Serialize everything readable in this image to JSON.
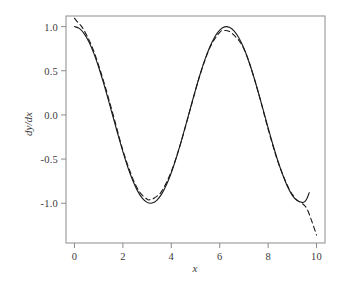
{
  "chart_data": {
    "type": "line",
    "title": "",
    "xlabel": "x",
    "ylabel": "dy/dx",
    "xlim": [
      -0.35,
      10.35
    ],
    "ylim": [
      -1.45,
      1.12
    ],
    "grid": false,
    "legend": "none",
    "xticks": [
      "0",
      "2",
      "4",
      "6",
      "8",
      "10"
    ],
    "xtick_values": [
      0,
      2,
      4,
      6,
      8,
      10
    ],
    "yticks": [
      "1.0",
      "0.5",
      "0.0",
      "-0.5",
      "-1.0"
    ],
    "ytick_values": [
      1.0,
      0.5,
      0.0,
      -0.5,
      -1.0
    ],
    "series": [
      {
        "name": "exact derivative",
        "style": "solid",
        "color": "#1a1a1a",
        "linewidth": 1.1,
        "x": [
          0.0,
          0.2,
          0.4,
          0.6,
          0.8,
          1.0,
          1.2,
          1.4,
          1.6,
          1.8,
          2.0,
          2.2,
          2.4,
          2.6,
          2.8,
          3.0,
          3.2,
          3.4,
          3.6,
          3.8,
          4.0,
          4.2,
          4.4,
          4.6,
          4.8,
          5.0,
          5.2,
          5.4,
          5.6,
          5.8,
          6.0,
          6.2,
          6.4,
          6.6,
          6.8,
          7.0,
          7.2,
          7.4,
          7.6,
          7.8,
          8.0,
          8.2,
          8.4,
          8.6,
          8.8,
          9.0,
          9.2,
          9.4,
          9.5,
          9.6,
          9.7
        ],
        "y": [
          1.0,
          0.98,
          0.921,
          0.825,
          0.697,
          0.54,
          0.362,
          0.17,
          -0.029,
          -0.227,
          -0.416,
          -0.589,
          -0.737,
          -0.857,
          -0.942,
          -0.99,
          -0.998,
          -0.967,
          -0.897,
          -0.791,
          -0.654,
          -0.49,
          -0.307,
          -0.112,
          0.087,
          0.284,
          0.469,
          0.635,
          0.775,
          0.886,
          0.96,
          0.997,
          0.993,
          0.95,
          0.869,
          0.754,
          0.608,
          0.438,
          0.251,
          0.055,
          -0.146,
          -0.338,
          -0.519,
          -0.675,
          -0.811,
          -0.911,
          -0.97,
          -0.99,
          -0.985,
          -0.95,
          -0.88
        ]
      },
      {
        "name": "spline approximation",
        "style": "dashed",
        "color": "#1a1a1a",
        "linewidth": 1.1,
        "dash_pattern": "5,3.5",
        "x": [
          0.0,
          0.15,
          0.3,
          0.5,
          0.8,
          1.2,
          1.6,
          2.0,
          2.4,
          2.7,
          3.0,
          3.1,
          3.3,
          3.6,
          4.0,
          4.4,
          4.8,
          5.2,
          5.6,
          6.0,
          6.2,
          6.4,
          6.6,
          6.9,
          7.2,
          7.6,
          8.0,
          8.4,
          8.8,
          9.0,
          9.2,
          9.4,
          9.6,
          9.8,
          10.0
        ],
        "y": [
          1.095,
          1.045,
          1.0,
          0.905,
          0.72,
          0.385,
          0.0,
          -0.4,
          -0.715,
          -0.875,
          -0.955,
          -0.96,
          -0.94,
          -0.865,
          -0.64,
          -0.31,
          0.08,
          0.465,
          0.765,
          0.935,
          0.955,
          0.945,
          0.9,
          0.8,
          0.61,
          0.25,
          -0.16,
          -0.525,
          -0.8,
          -0.9,
          -0.965,
          -1.0,
          -1.06,
          -1.2,
          -1.36
        ]
      }
    ]
  },
  "axes": {
    "frame_color": "#8c8c8c",
    "tick_color": "#8c8c8c",
    "label_color": "#3a3a3a",
    "background": "#ffffff"
  }
}
